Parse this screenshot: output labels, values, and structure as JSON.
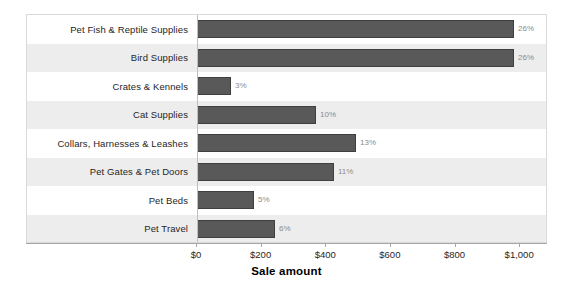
{
  "chart_data": {
    "type": "bar",
    "orientation": "horizontal",
    "title": "",
    "xlabel": "Sale amount",
    "ylabel": "",
    "xlim": [
      0,
      1080
    ],
    "xticks": [
      0,
      200,
      400,
      600,
      800,
      1000
    ],
    "xtick_labels": [
      "$0",
      "$200",
      "$400",
      "$600",
      "$800",
      "$1,000"
    ],
    "grid": false,
    "legend": null,
    "categories": [
      "Pet Fish & Reptile Supplies",
      "Bird Supplies",
      "Crates & Kennels",
      "Cat Supplies",
      "Collars, Harnesses & Leashes",
      "Pet Gates & Pet Doors",
      "Pet Beds",
      "Pet Travel"
    ],
    "values": [
      980,
      980,
      105,
      368,
      492,
      425,
      175,
      240
    ],
    "data_labels": [
      "26%",
      "26%",
      "3%",
      "10%",
      "13%",
      "11%",
      "5%",
      "6%"
    ],
    "series": [
      {
        "name": "Sale amount",
        "color": "#595959",
        "values": [
          980,
          980,
          105,
          368,
          492,
          425,
          175,
          240
        ]
      }
    ],
    "rows": [
      {
        "category": "Pet Fish & Reptile Supplies",
        "value": 980,
        "label": "26%",
        "band": "plain"
      },
      {
        "category": "Bird Supplies",
        "value": 980,
        "label": "26%",
        "band": "shaded"
      },
      {
        "category": "Crates & Kennels",
        "value": 105,
        "label": "3%",
        "band": "plain"
      },
      {
        "category": "Cat Supplies",
        "value": 368,
        "label": "10%",
        "band": "shaded"
      },
      {
        "category": "Collars, Harnesses & Leashes",
        "value": 492,
        "label": "13%",
        "band": "plain"
      },
      {
        "category": "Pet Gates & Pet Doors",
        "value": 425,
        "label": "11%",
        "band": "shaded"
      },
      {
        "category": "Pet Beds",
        "value": 175,
        "label": "5%",
        "band": "plain"
      },
      {
        "category": "Pet Travel",
        "value": 240,
        "label": "6%",
        "band": "shaded"
      }
    ]
  },
  "colors": {
    "bar_fill": "#595959",
    "bar_border": "#3f3f3f",
    "band_shaded": "#ededed",
    "band_plain": "#ffffff",
    "plot_border": "#d9d9d9",
    "axis_line": "#a6a6a6",
    "data_label_text": "#8c8c8c",
    "category_text": "#262626"
  }
}
